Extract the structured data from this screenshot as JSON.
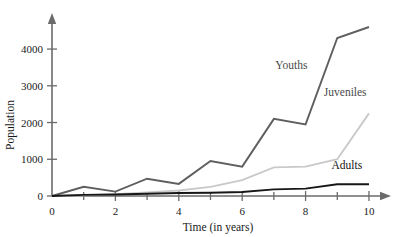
{
  "chart_data": {
    "type": "line",
    "title": "",
    "xlabel": "Time (in years)",
    "ylabel": "Population",
    "x": [
      0,
      1,
      2,
      3,
      4,
      5,
      6,
      7,
      8,
      9,
      10
    ],
    "xlim": [
      0,
      10.6
    ],
    "ylim": [
      0,
      4900
    ],
    "grid": false,
    "legend_position": "inline-right",
    "x_ticks_major": [
      0,
      2,
      4,
      6,
      8,
      10
    ],
    "x_ticks_minor": [
      1,
      3,
      5,
      7,
      9
    ],
    "x_ticklabels": [
      "0",
      "2",
      "4",
      "6",
      "8",
      "10"
    ],
    "y_ticks": [
      0,
      1000,
      2000,
      3000,
      4000
    ],
    "y_ticklabels": [
      "0",
      "1000",
      "2000",
      "3000",
      "4000"
    ],
    "series": [
      {
        "name": "Youths",
        "color": "#5f5f5f",
        "width": 1.9,
        "values": [
          0,
          250,
          120,
          470,
          330,
          950,
          800,
          2100,
          1950,
          4300,
          4600
        ],
        "label_x": 7.55,
        "label_y": 3450
      },
      {
        "name": "Juveniles",
        "color": "#c9c9c9",
        "width": 1.9,
        "values": [
          0,
          20,
          50,
          100,
          150,
          250,
          430,
          780,
          800,
          1000,
          2250
        ],
        "label_x": 9.25,
        "label_y": 2720
      },
      {
        "name": "Adults",
        "color": "#171717",
        "width": 1.9,
        "values": [
          0,
          30,
          40,
          60,
          80,
          90,
          110,
          180,
          200,
          320,
          320
        ],
        "label_x": 9.3,
        "label_y": 740
      }
    ]
  },
  "axes": {
    "x_title": "Time (in years)",
    "y_title": "Population"
  }
}
